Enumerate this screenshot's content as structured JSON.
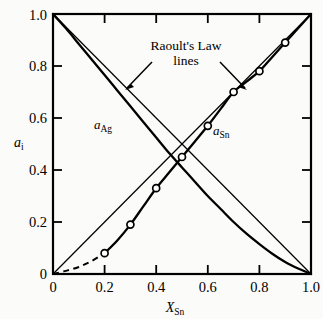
{
  "chart_data": {
    "type": "line",
    "title": "",
    "xlabel": "X_Sn",
    "xlabel_base": "X",
    "xlabel_sub": "Sn",
    "ylabel": "a_i",
    "ylabel_base": "a",
    "ylabel_sub": "i",
    "xlim": [
      0,
      1
    ],
    "ylim": [
      0,
      1
    ],
    "grid": false,
    "legend": "none",
    "xticks": [
      0,
      0.2,
      0.4,
      0.6,
      0.8,
      1
    ],
    "xticklabels": [
      "0",
      "0.2",
      "0.4",
      "0.6",
      "0.8",
      "1.0"
    ],
    "yticks": [
      0,
      0.2,
      0.4,
      0.6,
      0.8,
      1
    ],
    "yticklabels": [
      "0",
      "0.2",
      "0.4",
      "0.6",
      "0.8",
      "1.0"
    ],
    "series": [
      {
        "name": "a_Sn",
        "label_base": "a",
        "label_sub": "Sn",
        "style": "solid-with-markers",
        "marker": "open-circle",
        "x": [
          0,
          0.05,
          0.1,
          0.15,
          0.2,
          0.25,
          0.3,
          0.35,
          0.4,
          0.45,
          0.5,
          0.55,
          0.6,
          0.65,
          0.7,
          0.75,
          0.8,
          0.85,
          0.9,
          0.95,
          1.0
        ],
        "values": [
          0,
          0.012,
          0.027,
          0.05,
          0.08,
          0.13,
          0.19,
          0.26,
          0.33,
          0.39,
          0.45,
          0.51,
          0.57,
          0.635,
          0.7,
          0.74,
          0.78,
          0.835,
          0.89,
          0.945,
          1.0
        ],
        "dashed_segment_x": [
          0,
          0.2
        ],
        "dashed_segment_values": [
          0,
          0.08
        ],
        "marker_points": [
          {
            "x": 0.2,
            "y": 0.08
          },
          {
            "x": 0.3,
            "y": 0.19
          },
          {
            "x": 0.4,
            "y": 0.33
          },
          {
            "x": 0.5,
            "y": 0.45
          },
          {
            "x": 0.6,
            "y": 0.57
          },
          {
            "x": 0.7,
            "y": 0.7
          },
          {
            "x": 0.8,
            "y": 0.78
          },
          {
            "x": 0.9,
            "y": 0.89
          }
        ]
      },
      {
        "name": "a_Ag",
        "label_base": "a",
        "label_sub": "Ag",
        "style": "solid",
        "marker": "none",
        "x": [
          0,
          0.05,
          0.1,
          0.15,
          0.2,
          0.25,
          0.3,
          0.35,
          0.4,
          0.45,
          0.5,
          0.55,
          0.6,
          0.65,
          0.7,
          0.75,
          0.8,
          0.85,
          0.9,
          0.95,
          1.0
        ],
        "values": [
          1.0,
          0.945,
          0.885,
          0.825,
          0.765,
          0.705,
          0.645,
          0.585,
          0.525,
          0.465,
          0.41,
          0.355,
          0.3,
          0.25,
          0.2,
          0.155,
          0.115,
          0.078,
          0.046,
          0.021,
          0
        ]
      },
      {
        "name": "raoult-line-sn",
        "style": "straight-thin",
        "marker": "none",
        "x": [
          0,
          1
        ],
        "values": [
          0,
          1
        ]
      },
      {
        "name": "raoult-line-ag",
        "style": "straight-thin",
        "marker": "none",
        "x": [
          0,
          1
        ],
        "values": [
          1,
          0
        ]
      }
    ],
    "annotations": [
      {
        "name": "raoults-law-note",
        "line1": "Raoult's Law",
        "line2": "lines",
        "arrows": 2
      }
    ]
  },
  "labels": {
    "raoult_line1": "Raoult's Law",
    "raoult_line2": "lines",
    "a_sn_base": "a",
    "a_sn_sub": "Sn",
    "a_ag_base": "a",
    "a_ag_sub": "Ag",
    "y_axis_base": "a",
    "y_axis_sub": "i",
    "x_axis_base": "X",
    "x_axis_sub": "Sn",
    "x0": "0",
    "x02": "0.2",
    "x04": "0.4",
    "x06": "0.6",
    "x08": "0.8",
    "x10": "1.0",
    "y0": "0",
    "y02": "0.2",
    "y04": "0.4",
    "y06": "0.6",
    "y08": "0.8",
    "y10": "1.0"
  }
}
